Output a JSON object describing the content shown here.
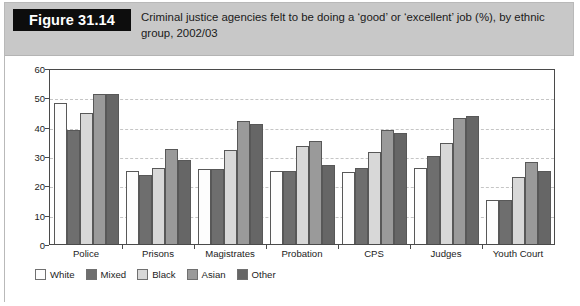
{
  "figure": {
    "badge_label": "Figure 31.14",
    "caption": "Criminal justice agencies felt to be doing a ‘good’ or ‘excellent’ job (%), by ethnic group, 2002/03"
  },
  "chart_data": {
    "type": "bar",
    "title": "Criminal justice agencies felt to be doing a ‘good’ or ‘excellent’ job (%), by ethnic group, 2002/03",
    "xlabel": "",
    "ylabel": "",
    "ylim": [
      0,
      60
    ],
    "yticks": [
      0,
      10,
      20,
      30,
      40,
      50,
      60
    ],
    "grid": true,
    "legend_position": "bottom-left",
    "categories": [
      "Police",
      "Prisons",
      "Magistrates",
      "Probation",
      "CPS",
      "Judges",
      "Youth Court"
    ],
    "series": [
      {
        "name": "White",
        "color": "#fdfdfd",
        "values": [
          48,
          25,
          25.5,
          25,
          24.5,
          26,
          15
        ]
      },
      {
        "name": "Mixed",
        "color": "#6e6e6e",
        "values": [
          39,
          23.5,
          25.5,
          25,
          26,
          30,
          15
        ]
      },
      {
        "name": "Black",
        "color": "#d8d8d8",
        "values": [
          44.5,
          26,
          32,
          33.5,
          31.5,
          34.5,
          23
        ]
      },
      {
        "name": "Asian",
        "color": "#9a9a9a",
        "values": [
          51,
          32.5,
          42,
          35,
          39,
          43,
          28
        ]
      },
      {
        "name": "Other",
        "color": "#666666",
        "values": [
          51,
          28.5,
          41,
          27,
          38,
          43.5,
          25
        ]
      }
    ]
  }
}
